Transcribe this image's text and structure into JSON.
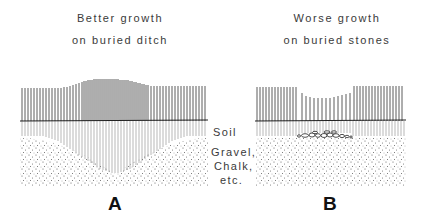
{
  "panels": [
    {
      "id": "A",
      "letter": "A",
      "caption_line1": "Better growth",
      "caption_line2": "on buried ditch",
      "feature": "buried ditch"
    },
    {
      "id": "B",
      "letter": "B",
      "caption_line1": "Worse growth",
      "caption_line2": "on buried stones",
      "feature": "buried stones"
    }
  ],
  "legend": {
    "soil": "Soil",
    "gravel": "Gravel,",
    "chalk": "Chalk,",
    "etc": "etc."
  },
  "colors": {
    "ink": "#2a2a2a",
    "background": "#ffffff"
  }
}
